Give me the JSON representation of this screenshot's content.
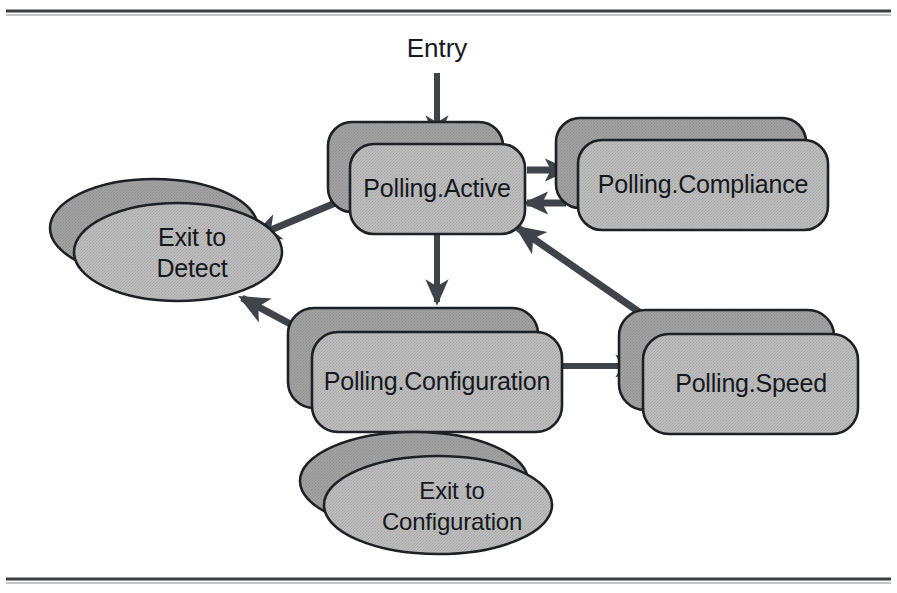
{
  "diagram": {
    "entry": {
      "label": "Entry"
    },
    "colors": {
      "back_fill": "#9b9b9b",
      "front_fill": "#b4b4b4",
      "ellipse_back_fill": "#9a9a9a",
      "ellipse_front_fill": "#b6b6b6",
      "stroke": "#1d2024",
      "arrow": "#3f444a",
      "text": "#15181c",
      "frame": "#3a3f45",
      "background": "#ffffff"
    },
    "nodes": [
      {
        "id": "polling-active",
        "label": "Polling.Active",
        "shape": "stacked-rounded-rect",
        "x": 350,
        "y": 144,
        "width": 175,
        "height": 90,
        "offset": 22
      },
      {
        "id": "polling-compliance",
        "label": "Polling.Compliance",
        "shape": "stacked-rounded-rect",
        "x": 578,
        "y": 118,
        "width": 250,
        "height": 90,
        "offset": 22
      },
      {
        "id": "polling-configuration",
        "label": "Polling.Configuration",
        "shape": "stacked-rounded-rect",
        "x": 312,
        "y": 308,
        "width": 250,
        "height": 100,
        "offset": 24
      },
      {
        "id": "polling-speed",
        "label": "Polling.Speed",
        "shape": "stacked-rounded-rect",
        "x": 643,
        "y": 310,
        "width": 215,
        "height": 100,
        "offset": 24
      },
      {
        "id": "exit-to-detect",
        "label_line1": "Exit to",
        "label_line2": "Detect",
        "shape": "stacked-ellipse",
        "cx": 178,
        "cy": 252,
        "rx": 104,
        "ry": 49,
        "offset": 24
      },
      {
        "id": "exit-to-configuration",
        "label_line1": "Exit to",
        "label_line2": "Configuration",
        "shape": "stacked-ellipse",
        "cx": 438,
        "cy": 505,
        "rx": 114,
        "ry": 49,
        "offset": 24
      }
    ],
    "edges": [
      {
        "id": "entry-to-active",
        "from": "Entry",
        "to": "Polling.Active",
        "style": "straight-down"
      },
      {
        "id": "active-to-compliance",
        "from": "Polling.Active",
        "to": "Polling.Compliance",
        "style": "short-right"
      },
      {
        "id": "compliance-to-active",
        "from": "Polling.Compliance",
        "to": "Polling.Active",
        "style": "short-left"
      },
      {
        "id": "active-to-exit-detect",
        "from": "Polling.Active",
        "to": "Exit to Detect",
        "style": "diagonal"
      },
      {
        "id": "active-to-configuration",
        "from": "Polling.Active",
        "to": "Polling.Configuration",
        "style": "straight-down"
      },
      {
        "id": "configuration-to-speed",
        "from": "Polling.Configuration",
        "to": "Polling.Speed",
        "style": "straight-right"
      },
      {
        "id": "speed-to-active",
        "from": "Polling.Speed",
        "to": "Polling.Active",
        "style": "diagonal"
      },
      {
        "id": "configuration-to-exit-detect",
        "from": "Polling.Configuration",
        "to": "Exit to Detect",
        "style": "diagonal"
      },
      {
        "id": "configuration-to-exit-config",
        "from": "Polling.Configuration",
        "to": "Exit to Configuration",
        "style": "straight-down"
      }
    ]
  }
}
